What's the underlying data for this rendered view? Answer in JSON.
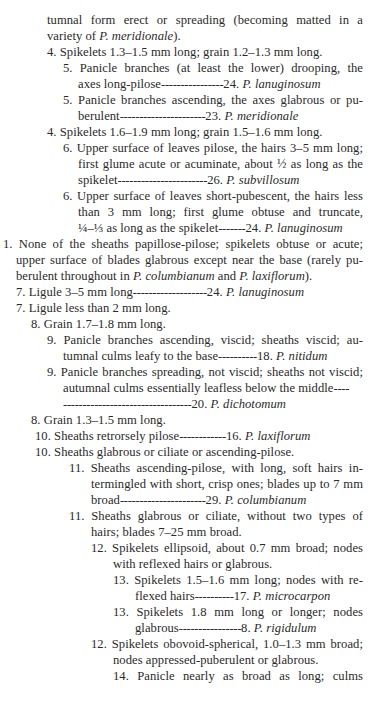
{
  "page": {
    "page_number_partial": "49",
    "lines": [
      {
        "x": 47,
        "y": 16,
        "w": 316,
        "just": true,
        "text": "tumnal form erect or spreading (becoming matted in a"
      },
      {
        "x": 47,
        "y": 32,
        "text": "variety of ",
        "italic": "P. meridionale",
        "after": ")."
      },
      {
        "x": 47,
        "y": 48,
        "text": "4. Spikelets 1.3–1.5 mm long; grain 1.2–1.3 mm long."
      },
      {
        "x": 63,
        "y": 64,
        "w": 300,
        "just": true,
        "text": "5. Panicle branches (at least the lower) drooping, the"
      },
      {
        "x": 78,
        "y": 80,
        "text": "axes long-pilose",
        "leader": "________________",
        "num": "24. ",
        "italic": "P. lanuginosum"
      },
      {
        "x": 63,
        "y": 96,
        "w": 300,
        "just": true,
        "text": "5. Panicle branches ascending, the axes glabrous or pu-"
      },
      {
        "x": 78,
        "y": 112,
        "text": "berulent",
        "leader": "______________________",
        "num": "23. ",
        "italic": "P. meridionale"
      },
      {
        "x": 47,
        "y": 128,
        "text": "4. Spikelets 1.6–1.9 mm long; grain 1.5–1.6 mm long."
      },
      {
        "x": 63,
        "y": 144,
        "w": 300,
        "just": true,
        "text": "6. Upper surface of leaves pilose, the hairs 3–5 mm long;"
      },
      {
        "x": 78,
        "y": 160,
        "w": 285,
        "just": true,
        "text": "first glume acute or acuminate, about ½ as long as the"
      },
      {
        "x": 78,
        "y": 176,
        "text": "spikelet",
        "leader": "_______________________",
        "num": "26. ",
        "italic": "P. subvillosum"
      },
      {
        "x": 63,
        "y": 192,
        "w": 300,
        "just": true,
        "text": "6. Upper surface of leaves short-pubescent, the hairs less"
      },
      {
        "x": 78,
        "y": 208,
        "w": 285,
        "just": true,
        "text": "than 3 mm long; first glume obtuse and truncate,"
      },
      {
        "x": 78,
        "y": 224,
        "text": "¼–⅓ as long as the spikelet",
        "leader": "_______",
        "num": "24. ",
        "italic": "P. lanuginosum"
      },
      {
        "x": 3,
        "y": 240,
        "w": 360,
        "just": true,
        "text": "1. None of the sheaths papillose-pilose; spikelets obtuse or acute;"
      },
      {
        "x": 16,
        "y": 256,
        "w": 347,
        "just": true,
        "text": "upper surface of blades glabrous except near the base (rarely pu-"
      },
      {
        "x": 16,
        "y": 272,
        "text": "berulent throughout in ",
        "italic": "P. columbianum",
        "after": " and ",
        "italic2": "P. laxiflorum",
        "after2": ")."
      },
      {
        "x": 16,
        "y": 288,
        "text": "7. Ligule 3–5 mm long",
        "leader": "___________________",
        "num": "24. ",
        "italic": "P. lanuginosum"
      },
      {
        "x": 16,
        "y": 304,
        "text": "7. Ligule less than 2 mm long."
      },
      {
        "x": 31,
        "y": 320,
        "text": "8. Grain 1.7–1.8 mm long."
      },
      {
        "x": 47,
        "y": 336,
        "w": 316,
        "just": true,
        "text": "9. Panicle branches ascending, viscid; sheaths viscid; au-"
      },
      {
        "x": 63,
        "y": 352,
        "text": "tumnal culms leafy to the base",
        "leader": "__________",
        "num": "18. ",
        "italic": "P. nitidum"
      },
      {
        "x": 47,
        "y": 368,
        "w": 316,
        "just": true,
        "text": "9. Panicle branches spreading, not viscid; sheaths not viscid;"
      },
      {
        "x": 63,
        "y": 384,
        "text": "autumnal culms essentially leafless below the middle",
        "leader": "____"
      },
      {
        "x": 63,
        "y": 400,
        "text": "",
        "leader": "_________________________________",
        "num": "20. ",
        "italic": "P. dichotomum"
      },
      {
        "x": 31,
        "y": 416,
        "text": "8. Grain 1.3–1.5 mm long."
      },
      {
        "x": 35,
        "y": 432,
        "text": "10. Sheaths retrorsely pilose",
        "leader": "____________",
        "num": "16. ",
        "italic": "P. laxiflorum"
      },
      {
        "x": 35,
        "y": 448,
        "text": "10. Sheaths glabrous or ciliate or ascending-pilose."
      },
      {
        "x": 69,
        "y": 464,
        "w": 294,
        "just": true,
        "text": "11. Sheaths ascending-pilose, with long, soft hairs in-"
      },
      {
        "x": 91,
        "y": 480,
        "w": 272,
        "just": true,
        "text": "termingled with short, crisp ones; blades up to 7 mm"
      },
      {
        "x": 91,
        "y": 496,
        "text": "broad",
        "leader": "______________________",
        "num": "29. ",
        "italic": "P. columbianum"
      },
      {
        "x": 69,
        "y": 512,
        "w": 294,
        "just": true,
        "text": "11. Sheaths glabrous or ciliate, without two types of"
      },
      {
        "x": 91,
        "y": 528,
        "text": "hairs; blades 7–25 mm broad."
      },
      {
        "x": 91,
        "y": 544,
        "w": 272,
        "just": true,
        "text": "12. Spikelets ellipsoid, about 0.7 mm broad; nodes"
      },
      {
        "x": 113,
        "y": 560,
        "text": "with reflexed hairs or glabrous."
      },
      {
        "x": 113,
        "y": 576,
        "w": 250,
        "just": true,
        "text": "13. Spikelets 1.5–1.6 mm long; nodes with re-"
      },
      {
        "x": 135,
        "y": 592,
        "text": "flexed hairs",
        "leader": "__________",
        "num": "17. ",
        "italic": "P. microcarpon"
      },
      {
        "x": 113,
        "y": 608,
        "w": 250,
        "just": true,
        "text": "13. Spikelets 1.8 mm long or longer; nodes"
      },
      {
        "x": 135,
        "y": 624,
        "text": "glabrous",
        "leader": "________________",
        "num": "8. ",
        "italic": "P. rigidulum"
      },
      {
        "x": 91,
        "y": 640,
        "w": 272,
        "just": true,
        "text": "12. Spikelets obovoid-spherical, 1.0–1.3 mm broad;"
      },
      {
        "x": 113,
        "y": 656,
        "text": "nodes appressed-puberulent or glabrous."
      },
      {
        "x": 113,
        "y": 672,
        "w": 250,
        "just": true,
        "text": "14. Panicle nearly as broad as long; culms"
      }
    ]
  }
}
